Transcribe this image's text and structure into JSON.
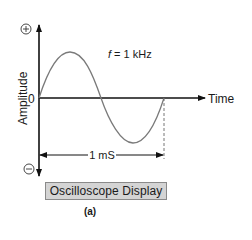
{
  "diagram": {
    "frequency_label": "f = 1 kHz",
    "frequency_symbol": "f",
    "frequency_value": " = 1 kHz",
    "y_axis_label": "Amplitude",
    "x_axis_label": "Time",
    "zero_label": "0",
    "positive_symbol": "+",
    "negative_symbol": "−",
    "period_label": "1 mS",
    "display_label": "Oscilloscope Display",
    "caption": "(a)"
  },
  "colors": {
    "axis": "#111111",
    "waveform": "#7a7a7a",
    "box_fill": "#d4d4d4",
    "box_border": "#8a8a8a"
  }
}
